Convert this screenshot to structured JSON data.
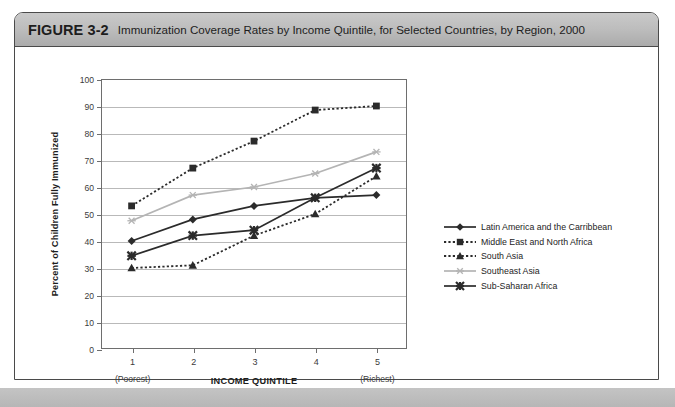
{
  "figure": {
    "number": "FIGURE 3-2",
    "caption": "Immunization Coverage Rates by Income Quintile, for Selected Countries, by Region, 2000"
  },
  "chart_data": {
    "type": "line",
    "title": "Immunization Coverage Rates by Income Quintile, for Selected Countries, by Region, 2000",
    "xlabel": "INCOME QUINTILE",
    "ylabel": "Percent of Children Fully Immunized",
    "categories": [
      "1",
      "2",
      "3",
      "4",
      "5"
    ],
    "category_notes": {
      "first": "(Poorest)",
      "last": "(Richest)"
    },
    "ylim": [
      0,
      100
    ],
    "yticks": [
      0,
      10,
      20,
      30,
      40,
      50,
      60,
      70,
      80,
      90,
      100
    ],
    "grid": true,
    "legend_position": "right",
    "series": [
      {
        "name": "Latin America and the Carribbean",
        "values": [
          40,
          48,
          53,
          56,
          57
        ],
        "color": "#2b2b2b",
        "marker": "diamond",
        "linestyle": "solid"
      },
      {
        "name": "Middle East and North Africa",
        "values": [
          53,
          67,
          77,
          88.5,
          90
        ],
        "color": "#2b2b2b",
        "marker": "square",
        "linestyle": "dotted"
      },
      {
        "name": "South Asia",
        "values": [
          30,
          31,
          42,
          50,
          64
        ],
        "color": "#2b2b2b",
        "marker": "triangle",
        "linestyle": "dotted"
      },
      {
        "name": "Southeast Asia",
        "values": [
          47.5,
          57,
          60,
          65,
          73
        ],
        "color": "#b4b4b4",
        "marker": "star",
        "linestyle": "solid"
      },
      {
        "name": "Sub-Saharan Africa",
        "values": [
          34.5,
          42,
          44,
          56,
          67
        ],
        "color": "#2b2b2b",
        "marker": "xstar",
        "linestyle": "solid"
      }
    ]
  }
}
